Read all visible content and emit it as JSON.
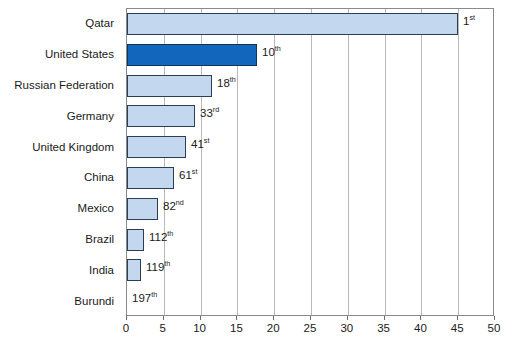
{
  "chart_data": {
    "type": "bar",
    "orientation": "horizontal",
    "title": "",
    "subtitle": "",
    "xlabel": "",
    "ylabel": "",
    "xlim": [
      0,
      50
    ],
    "ylim": null,
    "grid": "vertical",
    "legend": "none",
    "categories": [
      "Qatar",
      "United States",
      "Russian Federation",
      "Germany",
      "United Kingdom",
      "China",
      "Mexico",
      "Brazil",
      "India",
      "Burundi"
    ],
    "values": [
      45.0,
      17.6,
      11.5,
      9.3,
      8.0,
      6.4,
      4.2,
      2.3,
      1.9,
      0.0
    ],
    "xticks": [
      0,
      5,
      10,
      15,
      20,
      25,
      30,
      35,
      40,
      45,
      50
    ],
    "xtick_labels": [
      "0",
      "5",
      "10",
      "15",
      "20",
      "25",
      "30",
      "35",
      "40",
      "45",
      "50"
    ],
    "annotations": [
      {
        "category": "Qatar",
        "text": "1",
        "suffix": "st"
      },
      {
        "category": "United States",
        "text": "10",
        "suffix": "th"
      },
      {
        "category": "Russian Federation",
        "text": "18",
        "suffix": "th"
      },
      {
        "category": "Germany",
        "text": "33",
        "suffix": "rd"
      },
      {
        "category": "United Kingdom",
        "text": "41",
        "suffix": "st"
      },
      {
        "category": "China",
        "text": "61",
        "suffix": "st"
      },
      {
        "category": "Mexico",
        "text": "82",
        "suffix": "nd"
      },
      {
        "category": "Brazil",
        "text": "112",
        "suffix": "th"
      },
      {
        "category": "India",
        "text": "119",
        "suffix": "th"
      },
      {
        "category": "Burundi",
        "text": "197",
        "suffix": "th"
      }
    ],
    "colors": {
      "bar_default_fill": "#c3d8ee",
      "bar_default_stroke": "#2a3f55",
      "bar_highlight_fill": "#1266bc",
      "bar_highlight_stroke": "#10355c",
      "gridline": "#b9b9b9",
      "frame": "#8a8a8a",
      "background": "#ffffff",
      "text": "#1a1a1a"
    },
    "highlight_category": "United States"
  }
}
